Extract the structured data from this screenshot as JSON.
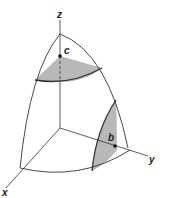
{
  "diagram": {
    "type": "3d-surface-octant",
    "axes": {
      "x_label": "x",
      "y_label": "y",
      "z_label": "z"
    },
    "points": [
      {
        "id": "c",
        "label": "c",
        "on_axis": "z"
      },
      {
        "id": "b",
        "label": "b",
        "on_axis": "y"
      }
    ],
    "regions": [
      {
        "name": "top-cap-region",
        "color": "#b8b8b8"
      },
      {
        "name": "side-region",
        "color": "#b8b8b8"
      }
    ],
    "colors": {
      "line": "#333333",
      "shade": "#b8b8b8"
    }
  }
}
